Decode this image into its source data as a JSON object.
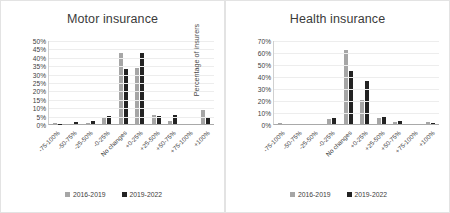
{
  "figure": {
    "background": "#ffffff",
    "series_colors": {
      "s1": "#a6a6a6",
      "s2": "#232323"
    }
  },
  "panels": [
    {
      "id": "motor",
      "title": "Motor insurance",
      "ylabel": "Percentage of insurers",
      "yticks": [
        "0%",
        "5%",
        "10%",
        "15%",
        "20%",
        "25%",
        "30%",
        "35%",
        "40%",
        "45%",
        "50%"
      ],
      "legend": [
        {
          "label": "2016-2019",
          "color": "#a6a6a6"
        },
        {
          "label": "2019-2022",
          "color": "#232323"
        }
      ]
    },
    {
      "id": "health",
      "title": "Health insurance",
      "ylabel": "Percentage of insurers",
      "yticks": [
        "0%",
        "10%",
        "20%",
        "30%",
        "40%",
        "50%",
        "60%",
        "70%"
      ],
      "legend": [
        {
          "label": "2016-2019",
          "color": "#a6a6a6"
        },
        {
          "label": "2019-2022",
          "color": "#232323"
        }
      ]
    }
  ],
  "chart_data": [
    {
      "type": "bar",
      "title": "Motor insurance",
      "xlabel": "",
      "ylabel": "Percentage of insurers",
      "ylim": [
        0,
        50
      ],
      "ytick_step": 5,
      "grid": true,
      "legend_position": "bottom",
      "categories": [
        "-75-100%",
        "-50-75%",
        "-25-50%",
        "-0-25%",
        "No changes",
        "+0-25%",
        "+25-50%",
        "+50-75%",
        "+75-100%",
        "+100%"
      ],
      "series": [
        {
          "name": "2016-2019",
          "color": "#a6a6a6",
          "values": [
            0.5,
            0.3,
            0.5,
            3.5,
            42.0,
            33.5,
            5.5,
            2.0,
            0.0,
            8.5
          ]
        },
        {
          "name": "2019-2022",
          "color": "#232323",
          "values": [
            0.3,
            1.0,
            1.8,
            4.8,
            33.0,
            42.5,
            4.5,
            5.5,
            0.0,
            4.3
          ]
        }
      ]
    },
    {
      "type": "bar",
      "title": "Health insurance",
      "xlabel": "",
      "ylabel": "Percentage of insurers",
      "ylim": [
        0,
        70
      ],
      "ytick_step": 10,
      "grid": true,
      "legend_position": "bottom",
      "categories": [
        "-75-100%",
        "-50-75%",
        "-25-50%",
        "-0-25%",
        "No changes",
        "+0-25%",
        "+25-50%",
        "+50-75%",
        "+75-100%",
        "+100%"
      ],
      "series": [
        {
          "name": "2016-2019",
          "color": "#a6a6a6",
          "values": [
            0.8,
            0.0,
            0.0,
            4.5,
            61.5,
            20.0,
            5.0,
            2.0,
            0.0,
            1.5
          ]
        },
        {
          "name": "2019-2022",
          "color": "#232323",
          "values": [
            0.0,
            0.0,
            0.0,
            5.0,
            44.5,
            35.5,
            6.0,
            2.5,
            0.0,
            1.2
          ]
        }
      ]
    }
  ]
}
